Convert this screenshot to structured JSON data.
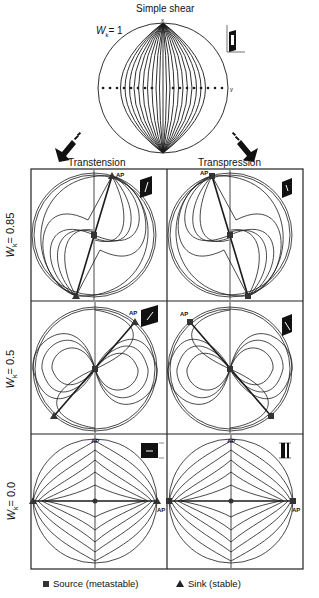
{
  "top": {
    "title": "Simple shear",
    "wk_label": "W",
    "wk_sub": "k",
    "wk_value": "= 1",
    "axis_x": "x",
    "axis_y": "y"
  },
  "arrows": {
    "left": "Transtension",
    "right": "Transpression"
  },
  "rows": [
    {
      "wk_label": "W",
      "wk_sub": "k",
      "wk_value": "= 0.85"
    },
    {
      "wk_label": "W",
      "wk_sub": "k",
      "wk_value": "= 0.5"
    },
    {
      "wk_label": "W",
      "wk_sub": "k",
      "wk_value": "= 0.0"
    }
  ],
  "panel_marker": "AP",
  "legend": {
    "source": "Source (metastable)",
    "sink": "Sink (stable)"
  },
  "colors": {
    "line": "#1a1a1a",
    "frame": "#222222",
    "marker": "#333333"
  }
}
